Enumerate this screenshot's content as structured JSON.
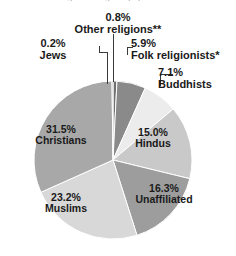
{
  "figure": {
    "title_remnant": "global religious population",
    "background": "#ffffff",
    "text_color": "#1a1a1a",
    "outline_color": "#4d4d4d"
  },
  "chart_data": {
    "type": "pie",
    "title": "",
    "start_angle_deg": 0,
    "direction": "clockwise",
    "total": 100.0,
    "units": "%",
    "legend": "none",
    "labels_inside": [
      "Christians",
      "Muslims",
      "Unaffiliated",
      "Hindus"
    ],
    "labels_outside": [
      "Buddhists",
      "Folk religionists*",
      "Other religions**",
      "Jews"
    ],
    "categories": [
      "Other religions**",
      "Folk religionists*",
      "Buddhists",
      "Hindus",
      "Unaffiliated",
      "Muslims",
      "Christians",
      "Jews"
    ],
    "values": [
      0.8,
      5.9,
      7.1,
      15.0,
      16.3,
      23.2,
      31.5,
      0.2
    ],
    "colors": [
      "#6f6f6f",
      "#8a8a8a",
      "#ececec",
      "#c9c9c9",
      "#9d9d9d",
      "#d8d8d8",
      "#a8a8a8",
      "#767676"
    ],
    "slices": [
      {
        "label": "Other religions**",
        "pct": "0.8%",
        "value": 0.8,
        "color": "#6f6f6f",
        "label_placement": "outside"
      },
      {
        "label": "Folk religionists*",
        "pct": "5.9%",
        "value": 5.9,
        "color": "#8a8a8a",
        "label_placement": "outside"
      },
      {
        "label": "Buddhists",
        "pct": "7.1%",
        "value": 7.1,
        "color": "#ececec",
        "label_placement": "outside"
      },
      {
        "label": "Hindus",
        "pct": "15.0%",
        "value": 15.0,
        "color": "#c9c9c9",
        "label_placement": "inside"
      },
      {
        "label": "Unaffiliated",
        "pct": "16.3%",
        "value": 16.3,
        "color": "#9d9d9d",
        "label_placement": "inside"
      },
      {
        "label": "Muslims",
        "pct": "23.2%",
        "value": 23.2,
        "color": "#d8d8d8",
        "label_placement": "inside"
      },
      {
        "label": "Christians",
        "pct": "31.5%",
        "value": 31.5,
        "color": "#a8a8a8",
        "label_placement": "inside"
      },
      {
        "label": "Jews",
        "pct": "0.2%",
        "value": 0.2,
        "color": "#767676",
        "label_placement": "outside"
      }
    ],
    "footnote_markers": [
      "*",
      "**"
    ]
  },
  "labels": {
    "other": {
      "pct": "0.8%",
      "name": "Other religions**"
    },
    "jews": {
      "pct": "0.2%",
      "name": "Jews"
    },
    "folk": {
      "pct": "5.9%",
      "name": "Folk religionists*"
    },
    "buddhists": {
      "pct": "7.1%",
      "name": "Buddhists"
    },
    "hindus": {
      "pct": "15.0%",
      "name": "Hindus"
    },
    "unaffiliated": {
      "pct": "16.3%",
      "name": "Unaffiliated"
    },
    "muslims": {
      "pct": "23.2%",
      "name": "Muslims"
    },
    "christians": {
      "pct": "31.5%",
      "name": "Christians"
    }
  }
}
